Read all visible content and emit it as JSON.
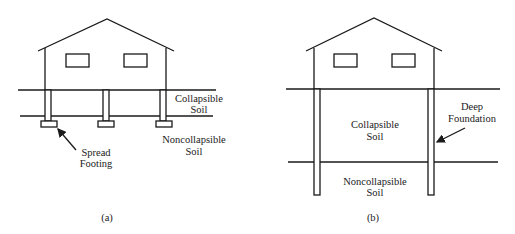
{
  "figure": {
    "panel_a": {
      "caption": "(a)",
      "labels": {
        "collapsible_line1": "Collapsible",
        "collapsible_line2": "Soil",
        "noncollapsible_line1": "Noncollapsible",
        "noncollapsible_line2": "Soil",
        "footing_line1": "Spread",
        "footing_line2": "Footing"
      }
    },
    "panel_b": {
      "caption": "(b)",
      "labels": {
        "collapsible_line1": "Collapsible",
        "collapsible_line2": "Soil",
        "noncollapsible_line1": "Noncollapsible",
        "noncollapsible_line2": "Soil",
        "foundation_line1": "Deep",
        "foundation_line2": "Foundation"
      }
    },
    "colors": {
      "line": "#1a1a1a",
      "background": "#ffffff"
    }
  }
}
